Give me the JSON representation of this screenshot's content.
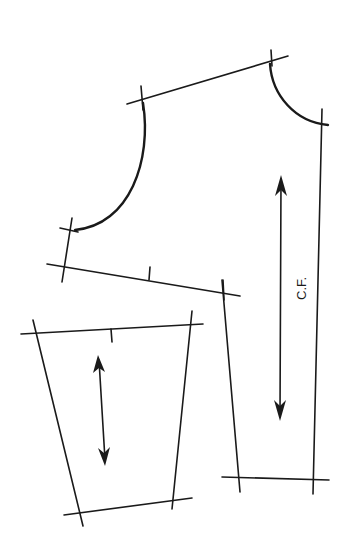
{
  "diagram": {
    "type": "sewing pattern",
    "pieces": [
      {
        "name": "bodice-front",
        "grainline_label": "C.F."
      },
      {
        "name": "sleeve-or-skirt-piece",
        "grainline_label": ""
      }
    ],
    "labels": {
      "center_front": "C.F."
    },
    "colors": {
      "ink": "#1a1a1a",
      "paper": "#ffffff"
    }
  }
}
